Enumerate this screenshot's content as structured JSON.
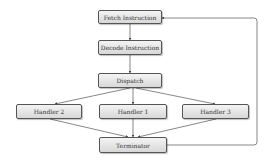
{
  "diagram": {
    "type": "flowchart",
    "nodes": {
      "fetch": {
        "label": "Fetch Instruction"
      },
      "decode": {
        "label": "Decode Instruction"
      },
      "dispatch": {
        "label": "Dispatch"
      },
      "handler2": {
        "label": "Handler 2"
      },
      "handler1": {
        "label": "Handler 1"
      },
      "handler3": {
        "label": "Handler 3"
      },
      "terminator": {
        "label": "Terminator"
      }
    },
    "edges": [
      {
        "from": "fetch",
        "to": "decode"
      },
      {
        "from": "decode",
        "to": "dispatch"
      },
      {
        "from": "dispatch",
        "to": "handler2"
      },
      {
        "from": "dispatch",
        "to": "handler1"
      },
      {
        "from": "dispatch",
        "to": "handler3"
      },
      {
        "from": "handler2",
        "to": "terminator"
      },
      {
        "from": "handler1",
        "to": "terminator"
      },
      {
        "from": "handler3",
        "to": "terminator"
      },
      {
        "from": "terminator",
        "to": "fetch"
      }
    ]
  }
}
